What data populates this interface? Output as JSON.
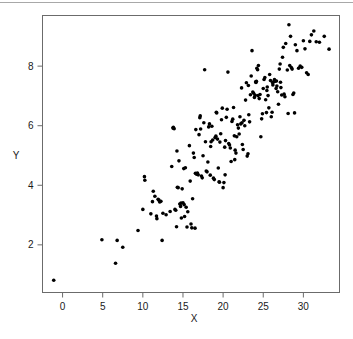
{
  "figure": {
    "background_color": "#ffffff",
    "rule_color": "#a8a8a8",
    "frame_color": "#6b6b6b",
    "point_color": "#000000"
  },
  "chart_data": {
    "type": "scatter",
    "title": "",
    "xlabel": "X",
    "ylabel": "Y",
    "xlim": [
      -2.5,
      34.5
    ],
    "ylim": [
      0.4,
      9.7
    ],
    "xticks": [
      0,
      5,
      10,
      15,
      20,
      25,
      30
    ],
    "yticks": [
      2,
      4,
      6,
      8
    ],
    "xtick_labels": [
      "0",
      "5",
      "10",
      "15",
      "20",
      "25",
      "30"
    ],
    "ytick_labels": [
      "2",
      "4",
      "6",
      "8"
    ],
    "grid": false,
    "legend": null,
    "marker": "filled-circle",
    "marker_size": 3,
    "n_points": 201,
    "points": [
      [
        -1.1,
        0.81
      ],
      [
        4.9,
        2.17
      ],
      [
        6.6,
        1.38
      ],
      [
        6.8,
        2.15
      ],
      [
        7.5,
        1.92
      ],
      [
        9.4,
        2.48
      ],
      [
        10.0,
        3.19
      ],
      [
        10.2,
        4.29
      ],
      [
        10.25,
        4.17
      ],
      [
        11.0,
        3.04
      ],
      [
        11.2,
        3.45
      ],
      [
        11.3,
        3.8
      ],
      [
        11.5,
        3.63
      ],
      [
        11.7,
        2.97
      ],
      [
        11.75,
        2.88
      ],
      [
        11.9,
        3.53
      ],
      [
        12.0,
        3.5
      ],
      [
        12.1,
        3.44
      ],
      [
        12.4,
        2.15
      ],
      [
        12.5,
        3.06
      ],
      [
        12.9,
        3.01
      ],
      [
        13.4,
        3.12
      ],
      [
        13.6,
        4.63
      ],
      [
        13.8,
        5.95
      ],
      [
        13.9,
        5.9
      ],
      [
        14.0,
        3.19
      ],
      [
        14.1,
        3.16
      ],
      [
        14.2,
        2.61
      ],
      [
        14.25,
        5.15
      ],
      [
        14.3,
        3.93
      ],
      [
        14.4,
        3.92
      ],
      [
        14.5,
        4.82
      ],
      [
        14.6,
        3.37
      ],
      [
        14.7,
        3.29
      ],
      [
        14.75,
        3.4
      ],
      [
        14.8,
        2.9
      ],
      [
        14.9,
        3.88
      ],
      [
        15.0,
        3.41
      ],
      [
        15.1,
        4.56
      ],
      [
        15.2,
        2.95
      ],
      [
        15.3,
        4.59
      ],
      [
        15.4,
        3.26
      ],
      [
        15.5,
        2.6
      ],
      [
        15.6,
        3.11
      ],
      [
        15.8,
        5.33
      ],
      [
        15.9,
        4.14
      ],
      [
        16.0,
        2.7
      ],
      [
        16.1,
        2.57
      ],
      [
        16.2,
        3.55
      ],
      [
        16.3,
        5.08
      ],
      [
        16.4,
        4.93
      ],
      [
        16.5,
        2.56
      ],
      [
        16.6,
        5.87
      ],
      [
        16.7,
        4.37
      ],
      [
        16.8,
        4.41
      ],
      [
        16.9,
        4.35
      ],
      [
        17.0,
        5.7
      ],
      [
        17.1,
        6.27
      ],
      [
        17.15,
        6.33
      ],
      [
        17.2,
        5.89
      ],
      [
        17.3,
        4.31
      ],
      [
        17.4,
        4.25
      ],
      [
        17.5,
        4.99
      ],
      [
        17.6,
        6.1
      ],
      [
        17.7,
        7.88
      ],
      [
        17.8,
        5.46
      ],
      [
        17.9,
        4.48
      ],
      [
        18.0,
        4.45
      ],
      [
        18.1,
        4.78
      ],
      [
        18.2,
        5.96
      ],
      [
        18.3,
        6.06
      ],
      [
        18.4,
        4.34
      ],
      [
        18.5,
        5.46
      ],
      [
        18.6,
        5.98
      ],
      [
        18.7,
        5.52
      ],
      [
        18.8,
        4.24
      ],
      [
        18.9,
        4.19
      ],
      [
        19.0,
        5.6
      ],
      [
        19.1,
        5.65
      ],
      [
        19.2,
        6.43
      ],
      [
        19.3,
        5.55
      ],
      [
        19.4,
        4.58
      ],
      [
        19.5,
        4.12
      ],
      [
        19.55,
        4.1
      ],
      [
        19.6,
        5.45
      ],
      [
        19.7,
        5.73
      ],
      [
        19.8,
        6.2
      ],
      [
        19.9,
        6.59
      ],
      [
        20.0,
        3.92
      ],
      [
        20.1,
        4.09
      ],
      [
        20.2,
        5.28
      ],
      [
        20.3,
        5.5
      ],
      [
        20.4,
        6.28
      ],
      [
        20.5,
        6.55
      ],
      [
        20.6,
        7.8
      ],
      [
        20.7,
        5.4
      ],
      [
        20.8,
        5.35
      ],
      [
        20.9,
        5.25
      ],
      [
        21.0,
        4.8
      ],
      [
        21.1,
        6.14
      ],
      [
        21.2,
        6.22
      ],
      [
        21.3,
        6.61
      ],
      [
        21.4,
        5.66
      ],
      [
        21.5,
        5.18
      ],
      [
        21.6,
        5.08
      ],
      [
        21.7,
        5.63
      ],
      [
        21.8,
        6.03
      ],
      [
        21.9,
        5.92
      ],
      [
        22.0,
        5.72
      ],
      [
        22.1,
        6.3
      ],
      [
        22.2,
        6.06
      ],
      [
        22.3,
        7.27
      ],
      [
        22.4,
        5.37
      ],
      [
        22.5,
        5.2
      ],
      [
        22.6,
        6.18
      ],
      [
        22.7,
        6.0
      ],
      [
        22.8,
        6.86
      ],
      [
        22.9,
        7.44
      ],
      [
        23.0,
        4.98
      ],
      [
        23.1,
        5.06
      ],
      [
        23.2,
        6.37
      ],
      [
        23.3,
        6.13
      ],
      [
        23.4,
        7.04
      ],
      [
        23.5,
        7.67
      ],
      [
        23.6,
        8.52
      ],
      [
        23.7,
        7.13
      ],
      [
        23.8,
        7.09
      ],
      [
        23.9,
        6.95
      ],
      [
        24.0,
        7.02
      ],
      [
        24.1,
        7.45
      ],
      [
        24.15,
        7.49
      ],
      [
        24.2,
        7.93
      ],
      [
        24.3,
        7.88
      ],
      [
        24.4,
        8.02
      ],
      [
        24.5,
        6.91
      ],
      [
        24.6,
        7.05
      ],
      [
        24.7,
        5.63
      ],
      [
        24.8,
        6.23
      ],
      [
        24.9,
        6.4
      ],
      [
        25.0,
        7.25
      ],
      [
        25.1,
        7.55
      ],
      [
        25.2,
        7.62
      ],
      [
        25.3,
        6.87
      ],
      [
        25.4,
        6.44
      ],
      [
        25.5,
        7.3
      ],
      [
        25.6,
        7.01
      ],
      [
        25.7,
        6.6
      ],
      [
        25.8,
        7.72
      ],
      [
        25.9,
        7.52
      ],
      [
        26.0,
        6.3
      ],
      [
        26.1,
        6.45
      ],
      [
        26.2,
        7.37
      ],
      [
        26.3,
        7.47
      ],
      [
        26.4,
        7.55
      ],
      [
        26.5,
        7.49
      ],
      [
        26.6,
        7.25
      ],
      [
        26.7,
        7.33
      ],
      [
        26.8,
        7.14
      ],
      [
        26.9,
        6.72
      ],
      [
        27.0,
        7.9
      ],
      [
        27.1,
        8.07
      ],
      [
        27.2,
        7.28
      ],
      [
        27.3,
        7.03
      ],
      [
        27.4,
        8.3
      ],
      [
        27.5,
        8.63
      ],
      [
        27.6,
        7.06
      ],
      [
        27.7,
        6.97
      ],
      [
        27.8,
        8.76
      ],
      [
        28.0,
        7.87
      ],
      [
        28.1,
        6.41
      ],
      [
        28.2,
        9.39
      ],
      [
        28.3,
        8.02
      ],
      [
        28.4,
        9.0
      ],
      [
        28.5,
        7.95
      ],
      [
        28.6,
        7.9
      ],
      [
        28.7,
        7.05
      ],
      [
        28.8,
        7.1
      ],
      [
        28.9,
        6.43
      ],
      [
        29.0,
        8.72
      ],
      [
        29.2,
        8.52
      ],
      [
        29.4,
        7.93
      ],
      [
        29.6,
        8.0
      ],
      [
        29.8,
        7.96
      ],
      [
        30.0,
        8.85
      ],
      [
        30.2,
        8.58
      ],
      [
        30.4,
        7.78
      ],
      [
        30.6,
        7.72
      ],
      [
        30.8,
        8.83
      ],
      [
        31.0,
        9.05
      ],
      [
        31.3,
        9.18
      ],
      [
        31.6,
        8.82
      ],
      [
        32.0,
        8.8
      ],
      [
        32.6,
        9.0
      ],
      [
        33.2,
        8.57
      ],
      [
        19.15,
        6.45
      ],
      [
        20.25,
        4.35
      ],
      [
        21.45,
        4.86
      ],
      [
        23.15,
        7.35
      ],
      [
        24.35,
        7.01
      ],
      [
        25.45,
        7.18
      ],
      [
        26.15,
        7.45
      ],
      [
        27.15,
        7.46
      ],
      [
        16.55,
        4.4
      ],
      [
        18.45,
        5.3
      ],
      [
        13.75,
        5.92
      ],
      [
        22.35,
        6.1
      ],
      [
        24.05,
        7.47
      ],
      [
        26.65,
        7.5
      ],
      [
        12.25,
        3.46
      ],
      [
        15.15,
        3.35
      ]
    ]
  }
}
